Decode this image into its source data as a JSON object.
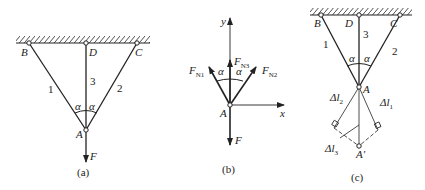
{
  "figure_a": {
    "caption": "(a)",
    "points": {
      "B": "B",
      "D": "D",
      "C": "C",
      "A": "A"
    },
    "bars": {
      "bar1": "1",
      "bar2": "2",
      "bar3": "3"
    },
    "angle_left": "α",
    "angle_right": "α",
    "force": "F"
  },
  "figure_b": {
    "caption": "(b)",
    "axis_x": "x",
    "axis_y": "y",
    "point": "A",
    "force_n1": "F",
    "force_n1_sub": "N1",
    "force_n2": "F",
    "force_n2_sub": "N2",
    "force_n3": "F",
    "force_n3_sub": "N3",
    "angle_left": "α",
    "angle_right": "α",
    "force": "F"
  },
  "figure_c": {
    "caption": "(c)",
    "points": {
      "B": "B",
      "D": "D",
      "C": "C",
      "A": "A",
      "A_prime": "A′"
    },
    "bars": {
      "bar1": "1",
      "bar2": "2",
      "bar3": "3"
    },
    "angle_left": "α",
    "angle_right": "α",
    "delta_l1": "Δl",
    "delta_l1_sub": "1",
    "delta_l2": "Δl",
    "delta_l2_sub": "2",
    "delta_l3": "Δl",
    "delta_l3_sub": "3"
  },
  "colors": {
    "ink": "#222222",
    "background": "#ffffff"
  }
}
